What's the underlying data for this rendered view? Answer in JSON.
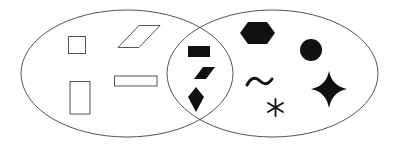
{
  "diagram": {
    "type": "venn",
    "stroke_color": "#555555",
    "fill_color": "#111111",
    "sets": [
      {
        "id": "left",
        "label": "outlined shapes"
      },
      {
        "id": "right",
        "label": "filled shapes"
      }
    ],
    "regions": {
      "left_only": [
        "square-outline",
        "parallelogram-outline",
        "tall-rectangle-outline",
        "wide-rectangle-outline"
      ],
      "intersection": [
        "filled-rectangle",
        "filled-parallelogram",
        "filled-kite"
      ],
      "right_only": [
        "filled-hexagon",
        "filled-circle",
        "tilde",
        "asterisk",
        "filled-four-point-star"
      ]
    }
  }
}
